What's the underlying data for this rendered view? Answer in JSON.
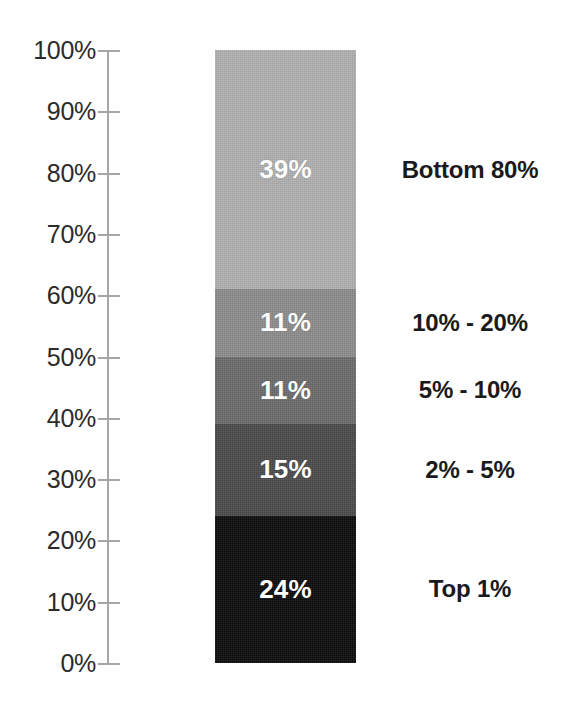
{
  "chart_data": {
    "type": "bar",
    "subtype": "stacked-100-percent-single-bar",
    "title": "",
    "subtitle": "",
    "xlabel": "",
    "ylabel": "",
    "ylim": [
      0,
      100
    ],
    "grid": false,
    "legend_position": "right-of-bar-inline",
    "axis_tick_labels": [
      "100%",
      "90%",
      "80%",
      "70%",
      "60%",
      "50%",
      "40%",
      "30%",
      "20%",
      "10%",
      "0%"
    ],
    "axis_tick_values": [
      100,
      90,
      80,
      70,
      60,
      50,
      40,
      30,
      20,
      10,
      0
    ],
    "categories": [
      "Bottom 80%",
      "10% - 20%",
      "5% - 10%",
      "2% - 5%",
      "Top 1%"
    ],
    "values": [
      39,
      11,
      11,
      15,
      24
    ],
    "value_labels": [
      "39%",
      "11%",
      "11%",
      "15%",
      "24%"
    ],
    "segments": [
      {
        "label": "Bottom 80%",
        "value": 39,
        "value_label": "39%",
        "color": "#b0b0b0",
        "cumulative_top": 100,
        "cumulative_bottom": 61
      },
      {
        "label": "10% - 20%",
        "value": 11,
        "value_label": "11%",
        "color": "#8c8c8c",
        "cumulative_top": 61,
        "cumulative_bottom": 50
      },
      {
        "label": "5% - 10%",
        "value": 11,
        "value_label": "11%",
        "color": "#6b6b6b",
        "cumulative_top": 50,
        "cumulative_bottom": 39
      },
      {
        "label": "2% - 5%",
        "value": 15,
        "value_label": "15%",
        "color": "#4a4a4a",
        "cumulative_top": 39,
        "cumulative_bottom": 24
      },
      {
        "label": "Top 1%",
        "value": 24,
        "value_label": "24%",
        "color": "#0a0a0a",
        "cumulative_top": 24,
        "cumulative_bottom": 0
      }
    ]
  },
  "axis": {
    "line_color": "#a6a6a6",
    "label_color": "#2b2b2b"
  },
  "labels": {
    "value_text_color": "#ffffff",
    "category_text_color": "#1a1a1a"
  }
}
